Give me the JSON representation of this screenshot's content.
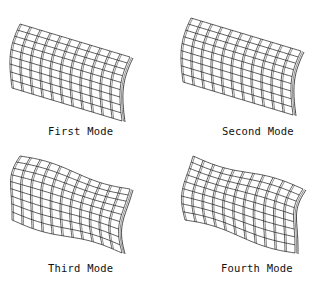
{
  "figure": {
    "modes": [
      {
        "label": "First Mode",
        "twist": 0,
        "warp": 0
      },
      {
        "label": "Second Mode",
        "twist": 0,
        "warp": 0
      },
      {
        "label": "Third Mode",
        "twist": 1,
        "warp": 1
      },
      {
        "label": "Fourth Mode",
        "twist": -1,
        "warp": 1
      }
    ],
    "mesh": {
      "rows": 9,
      "cols": 11,
      "line_color": "#1a1a1a"
    }
  }
}
